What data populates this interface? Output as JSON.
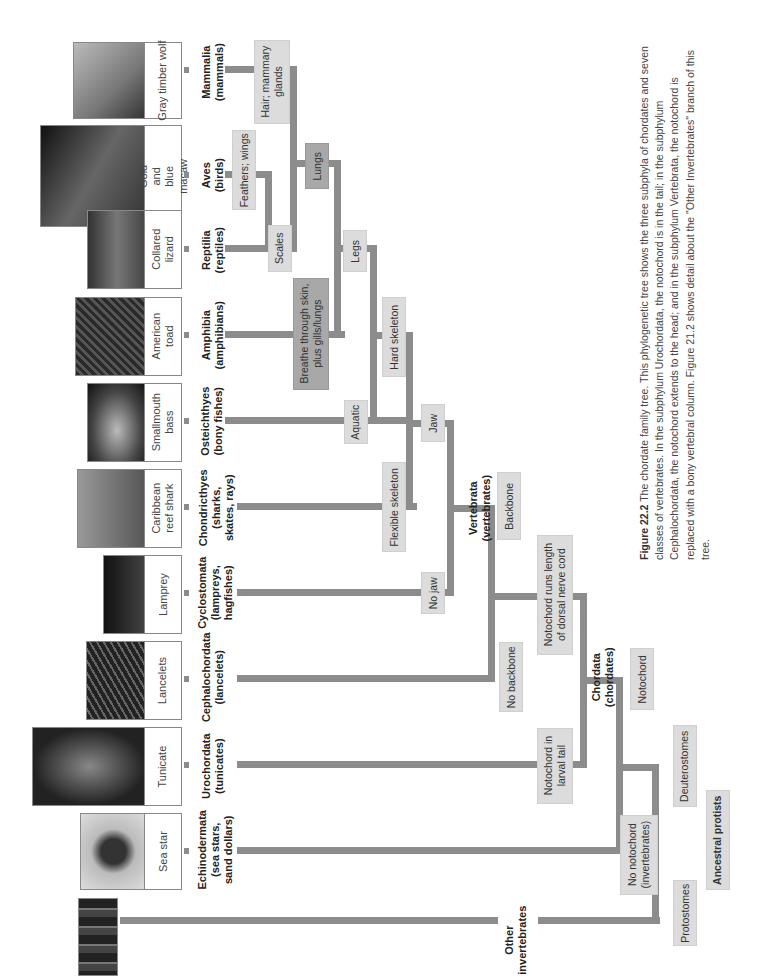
{
  "header": {
    "running_text": "Chapter 22 | The Diversity of Vertebrates"
  },
  "caption": {
    "figure_label": "Figure 22.2",
    "title": "The chordate family tree.",
    "text": "This phylogenetic tree shows the three subphyla of chordates and seven classes of vertebrates. In the subphylum Urochordata, the notochord is in the tail; in the subphylum Cephalochordata, the notochord extends to the head; and in the subphylum Vertebrata, the notochord is replaced with a bony vertebral column. Figure 21.2 shows detail about the \"Other Invertebrates\" branch of this tree."
  },
  "taxa": [
    {
      "photo": "Gray timber wolf",
      "name": "Mammalia",
      "common": "(mammals)"
    },
    {
      "photo": "Gold and blue macaw",
      "name": "Aves",
      "common": "(birds)"
    },
    {
      "photo": "Collared lizard",
      "name": "Reptilia",
      "common": "(reptiles)"
    },
    {
      "photo": "American toad",
      "name": "Amphibia",
      "common": "(amphibians)"
    },
    {
      "photo": "Smallmouth bass",
      "name": "Osteichthyes",
      "common": "(bony fishes)"
    },
    {
      "photo": "Caribbean reef shark",
      "name": "Chondricthyes",
      "common": "(sharks, skates, rays)"
    },
    {
      "photo": "Lamprey",
      "name": "Cyclostomata",
      "common": "(lampreys, hagfishes)"
    },
    {
      "photo": "Lancelets",
      "name": "Cephalochordata",
      "common": "(lancelets)"
    },
    {
      "photo": "Tunicate",
      "name": "Urochordata",
      "common": "(tunicates)"
    },
    {
      "photo": "Sea star",
      "name": "Echinodermata",
      "common": "(sea stars, sand dollars)"
    },
    {
      "photo": "",
      "name": "Other",
      "common": "invertebrates"
    }
  ],
  "traits": {
    "hair": "Hair; mammary glands",
    "feathers": "Feathers; wings",
    "lungs": "Lungs",
    "scales": "Scales",
    "legs": "Legs",
    "breathe": "Breathe through skin, plus gills/lungs",
    "hard_skeleton": "Hard skeleton",
    "aquatic": "Aquatic",
    "jaw": "Jaw",
    "flexible_skeleton": "Flexible skeleton",
    "no_jaw": "No jaw",
    "backbone": "Backbone",
    "notochord_length": "Notochord runs length of dorsal nerve cord",
    "no_backbone": "No backbone",
    "notochord_tail": "Notochord in larval tail",
    "notochord": "Notochord",
    "no_notochord": "No notochord (invertebrates)",
    "deuterostomes": "Deuterostomes",
    "protostomes": "Protostomes",
    "ancestral": "Ancestral protists"
  },
  "clades": {
    "vertebrata": {
      "name": "Vertebrata",
      "common": "(vertebrates)"
    },
    "chordata": {
      "name": "Chordata",
      "common": "(chordates)"
    }
  },
  "colors": {
    "line": "#8c8c8c",
    "trait_box": "#dcdcdc",
    "trait_box_dark": "#a8a8a8"
  }
}
